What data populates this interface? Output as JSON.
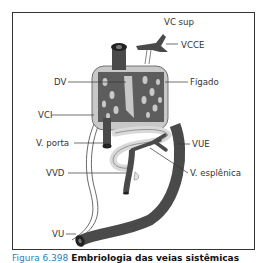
{
  "figure": {
    "labels": {
      "vc_sup": "VC sup",
      "vcce": "VCCE",
      "dv": "DV",
      "figado": "Fígado",
      "vci": "VCI",
      "v_porta": "V. porta",
      "vue": "VUE",
      "vvd": "VVD",
      "v_esplenica": "V. esplênica",
      "vu": "VU"
    },
    "caption": {
      "number": "Figura 6.398",
      "title": "Embriologia das veias sistêmicas"
    },
    "colors": {
      "vessel": "#4a4a4a",
      "liver": "#c8c8c8",
      "pale_vessel": "#d9d9d9",
      "frame": "#333333",
      "caption_number": "#2a7fc1"
    }
  }
}
